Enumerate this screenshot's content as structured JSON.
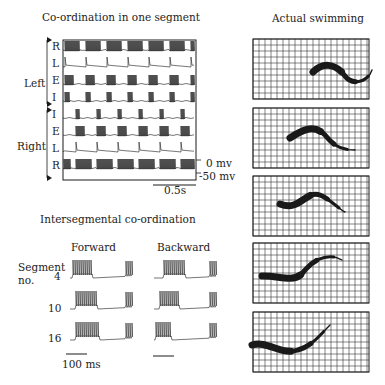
{
  "panel_one_segment": {
    "title": "Co-ordination in one segment",
    "group_left": "Left",
    "group_right": "Right",
    "trace_labels": [
      "R",
      "L",
      "E",
      "I",
      "I",
      "E",
      "L",
      "R"
    ],
    "voltage_labels": [
      "0 mv",
      "-50 mv"
    ],
    "scale_bar": "0.5s"
  },
  "panel_intersegmental": {
    "title": "Intersegmental co-ordination",
    "columns": [
      "Forward",
      "Backward"
    ],
    "row_header": "Segment\nno.",
    "row_header_line1": "Segment",
    "row_header_line2": "no.",
    "segments": [
      "4",
      "10",
      "16"
    ],
    "scale_bar": "100 ms"
  },
  "panel_swimming": {
    "title": "Actual swimming",
    "frames": 5
  },
  "colors": {
    "ink": "#1a1a1a",
    "grid": "#333333",
    "background": "#ffffff"
  }
}
